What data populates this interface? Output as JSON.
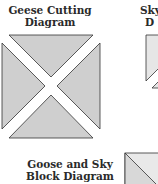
{
  "diagrams": [
    {
      "title_lines": [
        "Geese Cutting",
        "Diagram"
      ],
      "fill": "#cfcfcf",
      "stroke": "#333333"
    },
    {
      "title_lines": [
        "Sky",
        "D"
      ],
      "fill": "#e6e6e6",
      "stroke": "#333333"
    },
    {
      "title_lines": [
        "Goose and Sky",
        "Block Diagram"
      ],
      "fill_a": "#d8d8d8",
      "fill_b": "#e9e9e9",
      "stroke": "#333333"
    }
  ]
}
